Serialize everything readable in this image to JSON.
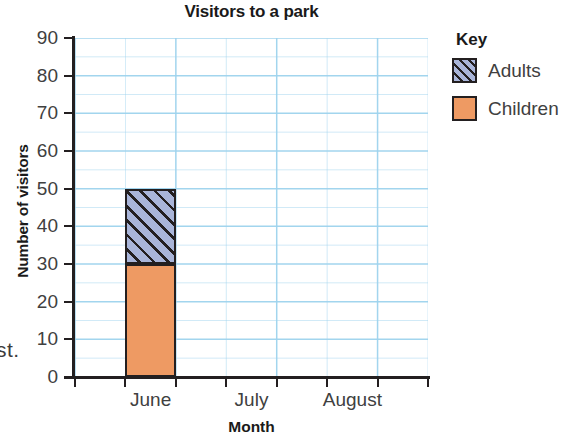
{
  "margin_fragment": "st.",
  "chart_data": {
    "type": "bar",
    "title": "Visitors to a park",
    "xlabel": "Month",
    "ylabel": "Number of visitors",
    "categories": [
      "June",
      "July",
      "August"
    ],
    "series": [
      {
        "name": "Children",
        "values": [
          30,
          null,
          null
        ],
        "color": "#ee9a63",
        "pattern": "solid"
      },
      {
        "name": "Adults",
        "values": [
          20,
          null,
          null
        ],
        "color": "#a9b5d9",
        "pattern": "diagonal-hatch"
      }
    ],
    "stacked": true,
    "stack_totals": [
      50,
      null,
      null
    ],
    "ylim": [
      0,
      90
    ],
    "yticks": [
      0,
      10,
      20,
      30,
      40,
      50,
      60,
      70,
      80,
      90
    ],
    "ytick_labels": [
      "0",
      "10",
      "20",
      "30",
      "40",
      "50",
      "60",
      "70",
      "80",
      "90"
    ],
    "grid": true,
    "grid_color": "#9ed3ee",
    "grid_minor_step": 5,
    "legend_title": "Key",
    "legend_position": "right",
    "legend_entries": [
      "Adults",
      "Children"
    ],
    "outline_color": "#231f20"
  },
  "axis": {
    "y_tick_labels": [
      "90",
      "80",
      "70",
      "60",
      "50",
      "40",
      "30",
      "20",
      "10",
      "0"
    ],
    "x_tick_labels": [
      "June",
      "July",
      "August"
    ]
  },
  "legend": {
    "title": "Key",
    "items": [
      {
        "label": "Adults",
        "swatch": "adults-swatch-icon"
      },
      {
        "label": "Children",
        "swatch": "children-swatch-icon"
      }
    ]
  }
}
